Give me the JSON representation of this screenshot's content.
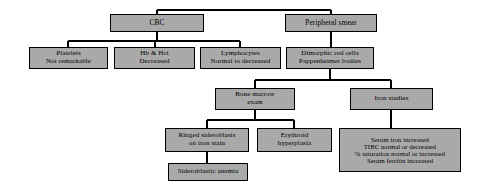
{
  "diagram": {
    "type": "flowchart",
    "style": {
      "node_fill": "#a9a9a9",
      "node_border": "#000000",
      "edge_color": "#000000",
      "background": "#ffffff"
    },
    "nodes": [
      {
        "id": "cbc",
        "lines": [
          "CBC"
        ],
        "x": 110,
        "y": 14,
        "w": 94,
        "h": 18,
        "size": "sz-10"
      },
      {
        "id": "peripheral-smear",
        "lines": [
          "Peripheral smear"
        ],
        "x": 285,
        "y": 14,
        "w": 92,
        "h": 18,
        "size": "sz-10"
      },
      {
        "id": "platelets",
        "lines": [
          "Platelets",
          "Not remarkable"
        ],
        "x": 29,
        "y": 47,
        "w": 79,
        "h": 22,
        "size": "sz-9"
      },
      {
        "id": "hb-hct",
        "lines": [
          "Hb & Hct",
          "Decreased"
        ],
        "x": 114,
        "y": 47,
        "w": 81,
        "h": 22,
        "size": "sz-9"
      },
      {
        "id": "lymphocytes",
        "lines": [
          "Lymphocytes",
          "Normal to decreased"
        ],
        "x": 200,
        "y": 47,
        "w": 81,
        "h": 22,
        "size": "sz-9"
      },
      {
        "id": "dimorphic-red-cells",
        "lines": [
          "Dimorphic red cells",
          "Pappenheimer bodies"
        ],
        "x": 286,
        "y": 47,
        "w": 88,
        "h": 22,
        "size": "sz-9"
      },
      {
        "id": "bone-marrow-exam",
        "lines": [
          "Bone marrow",
          "exam"
        ],
        "x": 215,
        "y": 88,
        "w": 80,
        "h": 22,
        "size": "sz-9"
      },
      {
        "id": "iron-studies",
        "lines": [
          "Iron studies"
        ],
        "x": 350,
        "y": 88,
        "w": 83,
        "h": 22,
        "size": "sz-9"
      },
      {
        "id": "ringed-sideroblasts",
        "lines": [
          "Ringed sideroblasts",
          "on iron stain"
        ],
        "x": 165,
        "y": 128,
        "w": 84,
        "h": 24,
        "size": "sz-9"
      },
      {
        "id": "erythroid-hyperplasia",
        "lines": [
          "Erythroid",
          "hyperplasia"
        ],
        "x": 257,
        "y": 128,
        "w": 75,
        "h": 24,
        "size": "sz-9"
      },
      {
        "id": "iron-studies-results",
        "lines": [
          "Serum iron increased",
          "TIBC normal or decreased",
          "% saturation normal or increased",
          "Serum ferritin increased"
        ],
        "x": 339,
        "y": 128,
        "w": 122,
        "h": 44,
        "size": "sz-8"
      },
      {
        "id": "sideroblastic-anemia",
        "lines": [
          "Sideroblastic anemia"
        ],
        "x": 168,
        "y": 163,
        "w": 80,
        "h": 18,
        "size": "sz-9"
      }
    ],
    "edges": [
      {
        "id": "root-to-cbc",
        "from": "root",
        "to": "cbc"
      },
      {
        "id": "root-to-peripheral-smear",
        "from": "root",
        "to": "peripheral-smear"
      },
      {
        "id": "cbc-to-platelets",
        "from": "cbc",
        "to": "platelets"
      },
      {
        "id": "cbc-to-hb-hct",
        "from": "cbc",
        "to": "hb-hct"
      },
      {
        "id": "cbc-to-lymphocytes",
        "from": "cbc",
        "to": "lymphocytes"
      },
      {
        "id": "peripheral-smear-to-dimorphic",
        "from": "peripheral-smear",
        "to": "dimorphic-red-cells"
      },
      {
        "id": "dimorphic-to-bone-marrow",
        "from": "dimorphic-red-cells",
        "to": "bone-marrow-exam"
      },
      {
        "id": "dimorphic-to-iron-studies",
        "from": "dimorphic-red-cells",
        "to": "iron-studies"
      },
      {
        "id": "bone-marrow-to-ringed",
        "from": "bone-marrow-exam",
        "to": "ringed-sideroblasts"
      },
      {
        "id": "bone-marrow-to-erythroid",
        "from": "bone-marrow-exam",
        "to": "erythroid-hyperplasia"
      },
      {
        "id": "iron-studies-to-results",
        "from": "iron-studies",
        "to": "iron-studies-results"
      },
      {
        "id": "ringed-to-sideroblastic-anemia",
        "from": "ringed-sideroblasts",
        "to": "sideroblastic-anemia"
      }
    ]
  }
}
